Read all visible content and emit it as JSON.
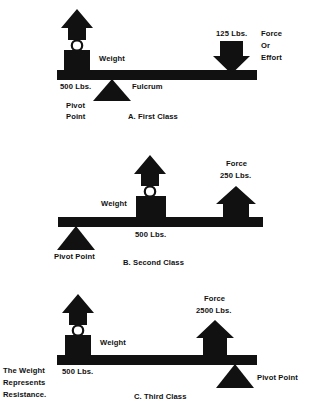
{
  "diagram": {
    "ink_color": "#111111",
    "background": "#ffffff"
  },
  "levers": [
    {
      "id": "first-class",
      "caption": "A. First Class",
      "weight_label": "Weight",
      "weight_value": "500 Lbs.",
      "pivot_label_line1": "Pivot",
      "pivot_label_line2": "Point",
      "fulcrum_label": "Fulcrum",
      "force_value": "125 Lbs.",
      "force_label_line1": "Force",
      "force_label_line2": "Or",
      "force_label_line3": "Effort",
      "force_direction": "down",
      "weight_direction": "up",
      "arrangement": "pivot between weight and force"
    },
    {
      "id": "second-class",
      "caption": "B. Second Class",
      "weight_label": "Weight",
      "weight_value": "500 Lbs.",
      "pivot_label": "Pivot Point",
      "force_label": "Force",
      "force_value": "250 Lbs.",
      "force_direction": "up",
      "weight_direction": "up",
      "arrangement": "weight between pivot and force"
    },
    {
      "id": "third-class",
      "caption": "C. Third Class",
      "weight_label": "Weight",
      "weight_value": "500 Lbs.",
      "pivot_label": "Pivot Point",
      "force_label": "Force",
      "force_value": "2500 Lbs.",
      "force_direction": "up",
      "weight_direction": "up",
      "note_line1": "The Weight",
      "note_line2": "Represents",
      "note_line3": "Resistance.",
      "arrangement": "force between weight and pivot"
    }
  ]
}
